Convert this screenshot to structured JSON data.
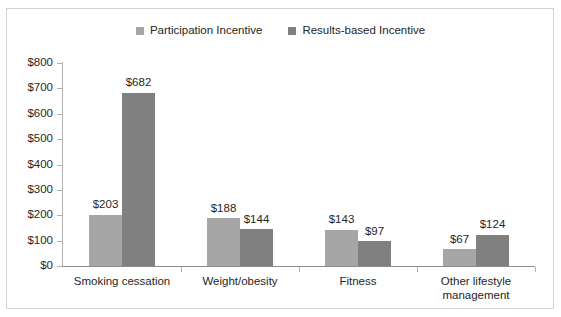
{
  "chart_data": {
    "type": "bar",
    "title": "",
    "xlabel": "",
    "ylabel": "",
    "ylim": [
      0,
      800
    ],
    "ytick_labels": [
      "$800",
      "$700",
      "$600",
      "$500",
      "$400",
      "$300",
      "$200",
      "$100",
      "$0"
    ],
    "ytick_values": [
      800,
      700,
      600,
      500,
      400,
      300,
      200,
      100,
      0
    ],
    "grid": false,
    "legend_position": "top-center",
    "categories": [
      "Smoking cessation",
      "Weight/obesity",
      "Fitness",
      "Other lifestyle\nmanagement"
    ],
    "series": [
      {
        "name": "Participation Incentive",
        "color": "#a6a6a6",
        "values": [
          203,
          188,
          143,
          67
        ],
        "labels": [
          "$203",
          "$188",
          "$143",
          "$67"
        ]
      },
      {
        "name": "Results-based Incentive",
        "color": "#808080",
        "values": [
          682,
          144,
          97,
          124
        ],
        "labels": [
          "$682",
          "$144",
          "$97",
          "$124"
        ]
      }
    ]
  },
  "legend": {
    "entries": [
      {
        "label": "Participation Incentive",
        "color": "#a6a6a6"
      },
      {
        "label": "Results-based Incentive",
        "color": "#808080"
      }
    ]
  },
  "colors": {
    "series_light": "#a6a6a6",
    "series_dark": "#808080",
    "axis": "#b0b0b0",
    "text": "#262626",
    "border": "#d4d4d4",
    "background": "#ffffff"
  }
}
